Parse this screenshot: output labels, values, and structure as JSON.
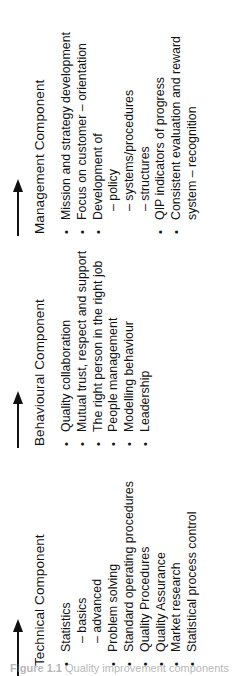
{
  "figure": {
    "orientation": "rotated-90-counterclockwise",
    "background_color": "#ffffff",
    "text_color": "#111111",
    "caption_label": "Figure 1.1",
    "caption_text": "Quality improvement components"
  },
  "components": [
    {
      "id": "technical",
      "heading": "Technical Component",
      "arrow_icon": "right-arrow-icon",
      "items": [
        {
          "marker": "•",
          "text": "Statistics",
          "type": "bullet"
        },
        {
          "marker": "",
          "text": "– basics",
          "type": "sub"
        },
        {
          "marker": "",
          "text": "– advanced",
          "type": "sub"
        },
        {
          "marker": "•",
          "text": "Problem solving",
          "type": "bullet"
        },
        {
          "marker": "•",
          "text": "Standard operating procedures",
          "type": "bullet"
        },
        {
          "marker": "•",
          "text": "Quality Procedures",
          "type": "bullet"
        },
        {
          "marker": "•",
          "text": "Quality Assurance",
          "type": "bullet"
        },
        {
          "marker": "•",
          "text": "Market research",
          "type": "bullet"
        },
        {
          "marker": "•",
          "text": "Statistical process control",
          "type": "bullet"
        }
      ]
    },
    {
      "id": "behavioural",
      "heading": "Behavioural Component",
      "arrow_icon": "right-arrow-icon",
      "items": [
        {
          "marker": "•",
          "text": "Quality collaboration",
          "type": "bullet"
        },
        {
          "marker": "•",
          "text": "Mutual trust, respect and support",
          "type": "bullet"
        },
        {
          "marker": "•",
          "text": "The right person in the right job",
          "type": "bullet"
        },
        {
          "marker": "•",
          "text": "People management",
          "type": "bullet"
        },
        {
          "marker": "•",
          "text": "Modelling behaviour",
          "type": "bullet"
        },
        {
          "marker": "•",
          "text": "Leadership",
          "type": "bullet"
        }
      ]
    },
    {
      "id": "management",
      "heading": "Management Component",
      "arrow_icon": "right-arrow-icon",
      "items": [
        {
          "marker": "•",
          "text": "Mission and strategy development",
          "type": "bullet"
        },
        {
          "marker": "•",
          "text": "Focus on customer – orientation",
          "type": "bullet"
        },
        {
          "marker": "•",
          "text": "Development of",
          "type": "bullet"
        },
        {
          "marker": "",
          "text": "– policy",
          "type": "sub"
        },
        {
          "marker": "",
          "text": "– systems/procedures",
          "type": "sub"
        },
        {
          "marker": "",
          "text": "– structures",
          "type": "sub"
        },
        {
          "marker": "•",
          "text": "QIP indicators of progress",
          "type": "bullet"
        },
        {
          "marker": "•",
          "text": "Consistent evaluation and reward",
          "type": "bullet"
        },
        {
          "marker": "",
          "text": "system – recognition",
          "type": "continuation"
        }
      ]
    }
  ]
}
